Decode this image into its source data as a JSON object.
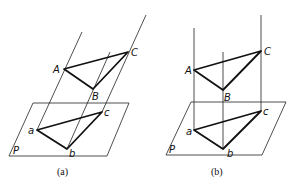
{
  "figures": [
    {
      "id": "a",
      "caption": "(a)",
      "projection_type": "oblique parallel projection",
      "labels": {
        "A": "A",
        "B": "B",
        "C": "C",
        "a": "a",
        "b": "b",
        "c": "c",
        "P": "P"
      }
    },
    {
      "id": "b",
      "caption": "(b)",
      "projection_type": "orthogonal parallel projection",
      "labels": {
        "A": "A",
        "B": "B",
        "C": "C",
        "a": "a",
        "b": "b",
        "c": "c",
        "P": "P"
      }
    }
  ]
}
